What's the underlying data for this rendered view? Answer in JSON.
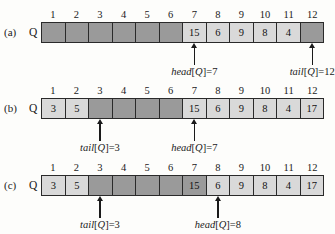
{
  "figure": {
    "columns": [
      1,
      2,
      3,
      4,
      5,
      6,
      7,
      8,
      9,
      10,
      11,
      12
    ],
    "array_label": "Q",
    "colors": {
      "filled_cell": "#d9d9d9",
      "empty_cell": "#9a9a9a",
      "border": "#2a2a2a",
      "arrow": "#1a1a1a",
      "page_background": "#fdfdfb"
    },
    "panels": [
      {
        "letter": "(a)",
        "array_label": "Q",
        "cells": [
          {
            "index": 1,
            "value": "",
            "state": "empty"
          },
          {
            "index": 2,
            "value": "",
            "state": "empty"
          },
          {
            "index": 3,
            "value": "",
            "state": "empty"
          },
          {
            "index": 4,
            "value": "",
            "state": "empty"
          },
          {
            "index": 5,
            "value": "",
            "state": "empty"
          },
          {
            "index": 6,
            "value": "",
            "state": "empty"
          },
          {
            "index": 7,
            "value": "15",
            "state": "filled"
          },
          {
            "index": 8,
            "value": "6",
            "state": "filled"
          },
          {
            "index": 9,
            "value": "9",
            "state": "filled"
          },
          {
            "index": 10,
            "value": "8",
            "state": "filled"
          },
          {
            "index": 11,
            "value": "4",
            "state": "filled"
          },
          {
            "index": 12,
            "value": "",
            "state": "empty"
          }
        ],
        "pointers": [
          {
            "name": "head",
            "bracket_open": "[",
            "var": "Q",
            "bracket_close": "]",
            "equals": "=",
            "value": "7",
            "index": 7
          },
          {
            "name": "tail",
            "bracket_open": "[",
            "var": "Q",
            "bracket_close": "]",
            "equals": "=",
            "value": "12",
            "index": 12
          }
        ]
      },
      {
        "letter": "(b)",
        "array_label": "Q",
        "cells": [
          {
            "index": 1,
            "value": "3",
            "state": "filled"
          },
          {
            "index": 2,
            "value": "5",
            "state": "filled"
          },
          {
            "index": 3,
            "value": "",
            "state": "empty"
          },
          {
            "index": 4,
            "value": "",
            "state": "empty"
          },
          {
            "index": 5,
            "value": "",
            "state": "empty"
          },
          {
            "index": 6,
            "value": "",
            "state": "empty"
          },
          {
            "index": 7,
            "value": "15",
            "state": "filled"
          },
          {
            "index": 8,
            "value": "6",
            "state": "filled"
          },
          {
            "index": 9,
            "value": "9",
            "state": "filled"
          },
          {
            "index": 10,
            "value": "8",
            "state": "filled"
          },
          {
            "index": 11,
            "value": "4",
            "state": "filled"
          },
          {
            "index": 12,
            "value": "17",
            "state": "filled"
          }
        ],
        "pointers": [
          {
            "name": "tail",
            "bracket_open": "[",
            "var": "Q",
            "bracket_close": "]",
            "equals": "=",
            "value": "3",
            "index": 3
          },
          {
            "name": "head",
            "bracket_open": "[",
            "var": "Q",
            "bracket_close": "]",
            "equals": "=",
            "value": "7",
            "index": 7
          }
        ]
      },
      {
        "letter": "(c)",
        "array_label": "Q",
        "cells": [
          {
            "index": 1,
            "value": "3",
            "state": "filled"
          },
          {
            "index": 2,
            "value": "5",
            "state": "filled"
          },
          {
            "index": 3,
            "value": "",
            "state": "empty"
          },
          {
            "index": 4,
            "value": "",
            "state": "empty"
          },
          {
            "index": 5,
            "value": "",
            "state": "empty"
          },
          {
            "index": 6,
            "value": "",
            "state": "empty"
          },
          {
            "index": 7,
            "value": "15",
            "state": "vacated"
          },
          {
            "index": 8,
            "value": "6",
            "state": "filled"
          },
          {
            "index": 9,
            "value": "9",
            "state": "filled"
          },
          {
            "index": 10,
            "value": "8",
            "state": "filled"
          },
          {
            "index": 11,
            "value": "4",
            "state": "filled"
          },
          {
            "index": 12,
            "value": "17",
            "state": "filled"
          }
        ],
        "pointers": [
          {
            "name": "tail",
            "bracket_open": "[",
            "var": "Q",
            "bracket_close": "]",
            "equals": "=",
            "value": "3",
            "index": 3
          },
          {
            "name": "head",
            "bracket_open": "[",
            "var": "Q",
            "bracket_close": "]",
            "equals": "=",
            "value": "8",
            "index": 8
          }
        ]
      }
    ]
  }
}
